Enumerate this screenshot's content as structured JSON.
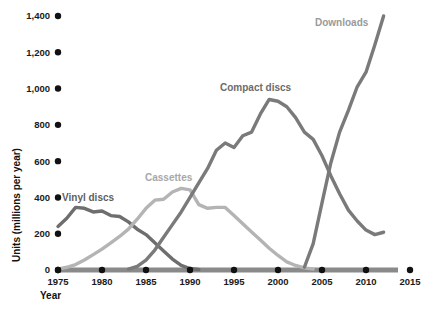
{
  "chart_data": {
    "type": "line",
    "title": "",
    "xlabel": "Year",
    "ylabel": "Units (millions per year)",
    "xlim": [
      1975,
      2015
    ],
    "ylim": [
      0,
      1400
    ],
    "grid": false,
    "legend_position": "inline-labels",
    "x_ticks": [
      "1975",
      "1980",
      "1985",
      "1990",
      "1995",
      "2000",
      "2005",
      "2010",
      "2015"
    ],
    "y_ticks": [
      "0",
      "200",
      "400",
      "600",
      "800",
      "1,000",
      "1,200",
      "1,400"
    ],
    "series": [
      {
        "name": "Vinyl discs",
        "color": "#6e6e6e",
        "label_color": "#5f5f5f",
        "x": [
          1975,
          1976,
          1977,
          1978,
          1979,
          1980,
          1981,
          1982,
          1983,
          1984,
          1985,
          1986,
          1987,
          1988,
          1989,
          1990,
          1991
        ],
        "values": [
          240,
          285,
          345,
          340,
          320,
          325,
          300,
          295,
          265,
          225,
          195,
          150,
          105,
          60,
          25,
          8,
          3
        ]
      },
      {
        "name": "Cassettes",
        "color": "#b4b4b4",
        "label_color": "#a8a8a8",
        "x": [
          1975,
          1976,
          1977,
          1978,
          1979,
          1980,
          1981,
          1982,
          1983,
          1984,
          1985,
          1986,
          1987,
          1988,
          1989,
          1990,
          1991,
          1992,
          1993,
          1994,
          1995,
          1996,
          1997,
          1998,
          1999,
          2000,
          2001,
          2002,
          2003,
          2004
        ],
        "values": [
          5,
          15,
          30,
          55,
          85,
          115,
          150,
          185,
          225,
          280,
          340,
          385,
          390,
          430,
          450,
          442,
          360,
          340,
          345,
          345,
          300,
          255,
          210,
          165,
          120,
          80,
          45,
          25,
          12,
          5
        ]
      },
      {
        "name": "Compact discs",
        "color": "#7a7a7a",
        "label_color": "#6b6b6b",
        "x": [
          1983,
          1984,
          1985,
          1986,
          1987,
          1988,
          1989,
          1990,
          1991,
          1992,
          1993,
          1994,
          1995,
          1996,
          1997,
          1998,
          1999,
          2000,
          2001,
          2002,
          2003,
          2004,
          2005,
          2006,
          2007,
          2008,
          2009,
          2010,
          2011,
          2012
        ],
        "values": [
          5,
          20,
          55,
          110,
          180,
          250,
          320,
          400,
          480,
          560,
          660,
          700,
          675,
          740,
          760,
          860,
          940,
          930,
          900,
          840,
          760,
          720,
          630,
          520,
          420,
          330,
          270,
          220,
          195,
          208
        ]
      },
      {
        "name": "Downloads",
        "color": "#7a7a7a",
        "label_color": "#9a9a9a",
        "x": [
          2003,
          2004,
          2005,
          2006,
          2007,
          2008,
          2009,
          2010,
          2011,
          2012
        ],
        "values": [
          15,
          145,
          370,
          590,
          760,
          880,
          1010,
          1090,
          1240,
          1400
        ]
      }
    ],
    "annotations": [
      {
        "text": "Vinyl discs",
        "x_px": 62,
        "y_px": 201,
        "color": "#5f5f5f"
      },
      {
        "text": "Cassettes",
        "x_px": 145,
        "y_px": 181,
        "color": "#a8a8a8"
      },
      {
        "text": "Compact discs",
        "x_px": 220,
        "y_px": 91,
        "color": "#6b6b6b"
      },
      {
        "text": "Downloads",
        "x_px": 315,
        "y_px": 26,
        "color": "#9a9a9a"
      }
    ],
    "axis_color": "#8a8a8a",
    "tick_dot_color": "#111111"
  }
}
